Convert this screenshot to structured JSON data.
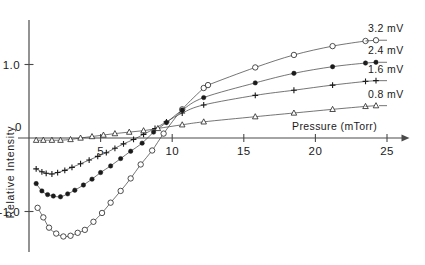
{
  "figure": {
    "background": "#ffffff",
    "ink_color": "#1a1a1a"
  },
  "chart_data": {
    "type": "scatter",
    "title": "",
    "subtitle": "",
    "xlabel": "Pressure (mTorr)",
    "ylabel": "Relative  Intensity",
    "origin_label": "0",
    "xlim": [
      0,
      26.5
    ],
    "ylim": [
      -1.45,
      1.45
    ],
    "grid": false,
    "x_ticks": [
      5,
      10,
      15,
      20,
      25
    ],
    "x_tick_labels": [
      "5",
      "10",
      "15",
      "20",
      "25"
    ],
    "y_ticks": [
      1.0,
      -1.0
    ],
    "y_tick_labels": [
      "1.0",
      "-1.0"
    ],
    "x_axis_arrow": true,
    "legend_position": "right-inline",
    "series": [
      {
        "name": "3.2 mV",
        "marker": "open-circle",
        "legend_label": "3.2 mV",
        "legend_y": 1.33,
        "x": [
          0.6,
          1.0,
          1.4,
          1.9,
          2.4,
          2.9,
          3.4,
          3.9,
          4.5,
          5.1,
          5.7,
          6.4,
          7.1,
          7.8,
          8.6,
          9.4,
          10.7,
          12.2,
          12.5,
          15.8,
          18.5,
          21.2,
          23.5
        ],
        "y": [
          -0.95,
          -1.08,
          -1.22,
          -1.3,
          -1.34,
          -1.33,
          -1.29,
          -1.25,
          -1.14,
          -1.02,
          -0.88,
          -0.72,
          -0.55,
          -0.36,
          -0.17,
          0.06,
          0.39,
          0.68,
          0.72,
          0.96,
          1.13,
          1.25,
          1.32
        ]
      },
      {
        "name": "2.4 mV",
        "marker": "filled-circle",
        "legend_label": "2.4 mV",
        "legend_y": 1.03,
        "x": [
          0.5,
          0.9,
          1.3,
          1.7,
          2.2,
          2.7,
          3.2,
          3.8,
          4.4,
          5.0,
          5.7,
          6.4,
          7.1,
          7.9,
          8.7,
          9.6,
          10.7,
          12.2,
          15.8,
          18.5,
          21.2,
          23.5
        ],
        "y": [
          -0.62,
          -0.72,
          -0.77,
          -0.79,
          -0.8,
          -0.76,
          -0.71,
          -0.64,
          -0.56,
          -0.47,
          -0.38,
          -0.28,
          -0.18,
          -0.07,
          0.08,
          0.21,
          0.38,
          0.55,
          0.75,
          0.88,
          0.97,
          1.02
        ]
      },
      {
        "name": "1.6 mV",
        "marker": "plus",
        "legend_label": "1.6 mV",
        "legend_y": 0.78,
        "x": [
          0.5,
          0.9,
          1.2,
          1.6,
          2.0,
          2.5,
          3.0,
          3.6,
          4.2,
          4.8,
          5.4,
          6.0,
          6.6,
          7.3,
          8.0,
          8.8,
          9.6,
          10.7,
          12.2,
          15.8,
          18.5,
          21.2,
          23.5
        ],
        "y": [
          -0.42,
          -0.46,
          -0.48,
          -0.49,
          -0.47,
          -0.44,
          -0.4,
          -0.35,
          -0.3,
          -0.25,
          -0.2,
          -0.14,
          -0.08,
          -0.02,
          0.05,
          0.13,
          0.22,
          0.34,
          0.45,
          0.58,
          0.65,
          0.72,
          0.77
        ]
      },
      {
        "name": "0.8 mV",
        "marker": "triangle",
        "legend_label": "0.8 mV",
        "legend_y": 0.44,
        "x": [
          0.5,
          1.0,
          1.6,
          2.2,
          2.9,
          3.6,
          4.4,
          5.2,
          6.0,
          7.0,
          8.0,
          9.0,
          10.7,
          12.2,
          15.8,
          18.5,
          21.2,
          23.5
        ],
        "y": [
          -0.03,
          -0.03,
          -0.03,
          -0.03,
          -0.02,
          0.0,
          0.02,
          0.04,
          0.06,
          0.08,
          0.1,
          0.13,
          0.18,
          0.22,
          0.29,
          0.34,
          0.39,
          0.43
        ]
      }
    ]
  }
}
